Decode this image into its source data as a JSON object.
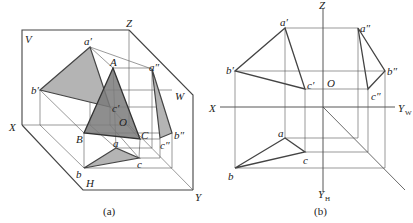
{
  "figure_a": {
    "caption": "(a)",
    "planes": {
      "V": "V",
      "W": "W",
      "H": "H"
    },
    "axes": {
      "X": "X",
      "Y": "Y",
      "Z": "Z",
      "O": "O"
    },
    "points": {
      "A": "A",
      "B": "B",
      "C": "C",
      "a_prime": "a′",
      "b_prime": "b′",
      "c_prime": "c′",
      "a_dprime": "a″",
      "b_dprime": "b″",
      "c_dprime": "c″",
      "a": "a",
      "b": "b",
      "c": "c"
    },
    "colors": {
      "projection_fill": "#b4b4b4",
      "solid_fill": "#7a7a7a",
      "line": "#444444"
    }
  },
  "figure_b": {
    "caption": "(b)",
    "axes": {
      "X": "X",
      "Z": "Z",
      "O": "O",
      "Y": "Y",
      "YW_sub": "W",
      "YH_sub": "H"
    },
    "points": {
      "a_prime": "a′",
      "b_prime": "b′",
      "c_prime": "c′",
      "a_dprime": "a″",
      "b_dprime": "b″",
      "c_dprime": "c″",
      "a": "a",
      "b": "b",
      "c": "c"
    }
  }
}
